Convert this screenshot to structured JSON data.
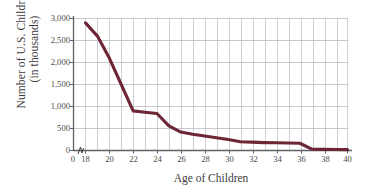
{
  "chart_data": {
    "type": "line",
    "title": "",
    "xlabel": "Age of Children",
    "ylabel_line1": "Number of U.S. Children",
    "ylabel_line2": "(in thousands)",
    "x": [
      18,
      19,
      20,
      21,
      22,
      23,
      24,
      25,
      26,
      27,
      28,
      29,
      30,
      31,
      32,
      33,
      34,
      35,
      36,
      37,
      38,
      39,
      40
    ],
    "values": [
      2900,
      2600,
      2100,
      1500,
      900,
      870,
      840,
      560,
      420,
      370,
      330,
      290,
      250,
      200,
      190,
      180,
      175,
      170,
      165,
      30,
      25,
      22,
      20
    ],
    "series": [
      {
        "name": "Number of U.S. Children (in thousands)",
        "color": "#6d2636",
        "values": [
          2900,
          2600,
          2100,
          1500,
          900,
          870,
          840,
          560,
          420,
          370,
          330,
          290,
          250,
          200,
          190,
          180,
          175,
          170,
          165,
          30,
          25,
          22,
          20
        ]
      }
    ],
    "xlim": [
      18,
      40
    ],
    "ylim": [
      0,
      3000
    ],
    "xticks": [
      18,
      20,
      22,
      24,
      26,
      28,
      30,
      32,
      34,
      36,
      38,
      40
    ],
    "xtick_labels": [
      "18",
      "20",
      "22",
      "24",
      "26",
      "28",
      "30",
      "32",
      "34",
      "36",
      "38",
      "40"
    ],
    "origin_tick_label": "0",
    "yticks": [
      0,
      500,
      1000,
      1500,
      2000,
      2500,
      3000
    ],
    "ytick_labels": [
      "0",
      "500",
      "1,000",
      "1,500",
      "2,000",
      "2,500",
      "3,000"
    ],
    "grid": true,
    "grid_minor_x_every": 1,
    "legend": "none",
    "axis_break": true,
    "colors": {
      "line": "#6d2636",
      "grid": "#b9bcc4",
      "axis": "#5f6268",
      "text": "#3d3d3d"
    }
  }
}
